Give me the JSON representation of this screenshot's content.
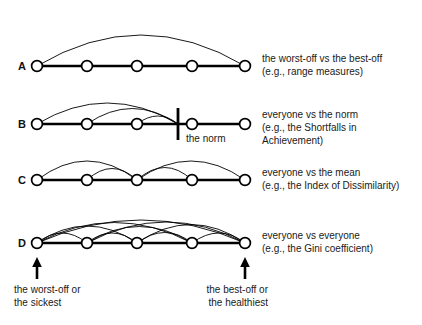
{
  "figure": {
    "background_color": "#ffffff",
    "ink_color": "#000000",
    "node_count_per_row": 5,
    "node_positions_x": [
      37,
      87,
      137,
      192,
      245
    ],
    "baseline_y": [
      66,
      124,
      180,
      243
    ]
  },
  "rows": [
    {
      "letter": "A",
      "approach": "the worst-off vs the best-off",
      "example": "(e.g., range measures)",
      "arcs": [
        [
          0,
          4
        ]
      ],
      "arc_count": 1
    },
    {
      "letter": "B",
      "approach": "everyone vs the norm",
      "example_line1": "(e.g., the Shortfalls in",
      "example_line2": "Achievement)",
      "norm_label": "the norm",
      "norm_x": 178,
      "arcs": [
        [
          0,
          "norm"
        ],
        [
          1,
          "norm"
        ],
        [
          2,
          "norm"
        ]
      ],
      "arc_count": 3
    },
    {
      "letter": "C",
      "approach": "everyone vs the mean",
      "example": "(e.g., the Index of Dissimilarity)",
      "arcs": [
        [
          0,
          2
        ],
        [
          1,
          2
        ],
        [
          2,
          3
        ],
        [
          2,
          4
        ]
      ],
      "arc_count": 4
    },
    {
      "letter": "D",
      "approach": "everyone vs everyone",
      "example": "(e.g., the Gini coefficient)",
      "arcs": [
        [
          0,
          1
        ],
        [
          0,
          2
        ],
        [
          0,
          3
        ],
        [
          0,
          4
        ],
        [
          1,
          2
        ],
        [
          1,
          3
        ],
        [
          1,
          4
        ],
        [
          2,
          3
        ],
        [
          2,
          4
        ],
        [
          3,
          4
        ]
      ],
      "arc_count": 10
    }
  ],
  "annotations": {
    "left_arrow": {
      "line1": "the worst-off or",
      "line2": "the sickest",
      "arrow_x": 37
    },
    "right_arrow": {
      "line1": "the best-off or",
      "line2": "the healthiest",
      "arrow_x": 245
    }
  }
}
